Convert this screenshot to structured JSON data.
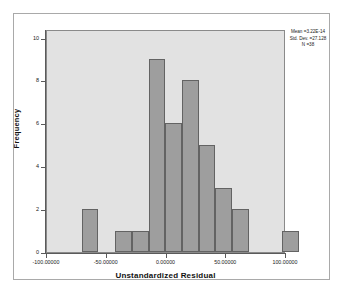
{
  "chart_data": {
    "type": "bar",
    "title": "",
    "subtitle": "",
    "xlabel": "Unstandardized Residual",
    "ylabel": "Frequency",
    "grid": false,
    "legend": "none",
    "xlim": [
      -100.0,
      100.0
    ],
    "ylim": [
      0,
      10.4
    ],
    "bin_width": 14.0,
    "x_tick_labels": [
      "-100.00000",
      "-50.00000",
      "0.00000",
      "50.00000",
      "100.00000"
    ],
    "x_tick_values": [
      -100,
      -50,
      0,
      50,
      100
    ],
    "y_tick_labels": [
      "0",
      "2",
      "4",
      "6",
      "8",
      "10"
    ],
    "y_tick_values": [
      0,
      2,
      4,
      6,
      8,
      10
    ],
    "bins": [
      {
        "left": -71.0,
        "right": -57.0,
        "center": -64.0,
        "count": 2
      },
      {
        "left": -43.0,
        "right": -29.0,
        "center": -36.0,
        "count": 1
      },
      {
        "left": -29.0,
        "right": -15.0,
        "center": -22.0,
        "count": 1
      },
      {
        "left": -15.0,
        "right": -1.0,
        "center": -8.0,
        "count": 9
      },
      {
        "left": -1.0,
        "right": 13.0,
        "center": 6.0,
        "count": 6
      },
      {
        "left": 13.0,
        "right": 27.0,
        "center": 20.0,
        "count": 8
      },
      {
        "left": 27.0,
        "right": 41.0,
        "center": 34.0,
        "count": 5
      },
      {
        "left": 41.0,
        "right": 55.0,
        "center": 48.0,
        "count": 3
      },
      {
        "left": 55.0,
        "right": 69.0,
        "center": 62.0,
        "count": 2
      },
      {
        "left": 97.0,
        "right": 111.0,
        "center": 104.0,
        "count": 1
      }
    ],
    "categories": [
      "-64.0",
      "-36.0",
      "-22.0",
      "-8.0",
      "6.0",
      "20.0",
      "34.0",
      "48.0",
      "62.0",
      "104.0"
    ],
    "values": [
      2,
      1,
      1,
      9,
      6,
      8,
      5,
      3,
      2,
      1
    ],
    "colors": {
      "bar_fill": "#9e9e9e",
      "bar_stroke": "#636363",
      "plot_background": "#e2e2e2",
      "figure_background": "#ffffff",
      "axis": "#5a5a5a",
      "text": "#1a1a1a"
    }
  },
  "axes": {
    "y_title": "Frequency",
    "x_title": "Unstandardized Residual"
  },
  "stats": {
    "mean_label": "Mean =3.22E-14",
    "std_dev_label": "Std. Dev. =27.128",
    "n_label": "N =38",
    "mean_value": "3.22E-14",
    "std_dev_value": "27.128",
    "n_value": "38"
  }
}
